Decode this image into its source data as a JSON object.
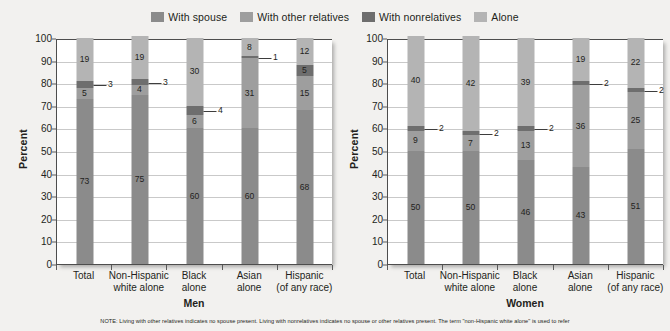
{
  "legend": {
    "items": [
      {
        "label": "With spouse",
        "color": "#8b8b8b"
      },
      {
        "label": "With other relatives",
        "color": "#9e9e9e"
      },
      {
        "label": "With nonrelatives",
        "color": "#6e6e6e"
      },
      {
        "label": "Alone",
        "color": "#b4b4b4"
      }
    ]
  },
  "note": "NOTE: Living with other relatives indicates no spouse present. Living with nonrelatives indicates no spouse or other relatives present. The term \"non-Hispanic white alone\" is used to refer",
  "axis": {
    "ylabel": "Percent",
    "yticks": [
      0,
      10,
      20,
      30,
      40,
      50,
      60,
      70,
      80,
      90,
      100
    ]
  },
  "panels": [
    {
      "key": "men",
      "title": "Men"
    },
    {
      "key": "women",
      "title": "Women"
    }
  ],
  "chart_data": {
    "type": "bar",
    "title": "",
    "subtitle": "",
    "xlabel": "",
    "ylabel": "Percent",
    "ylim": [
      0,
      100
    ],
    "ytick_step": 10,
    "grid": true,
    "stacked": true,
    "legend_position": "top-center",
    "legend_entries": [
      "With spouse",
      "With other relatives",
      "With nonrelatives",
      "Alone"
    ],
    "categories": [
      "Total",
      "Non-Hispanic white alone",
      "Black alone",
      "Asian alone",
      "Hispanic (of any race)"
    ],
    "panels": [
      {
        "name": "Men",
        "series": [
          {
            "name": "With spouse",
            "values": [
              73,
              75,
              60,
              60,
              68
            ]
          },
          {
            "name": "With other relatives",
            "values": [
              5,
              4,
              6,
              31,
              15
            ]
          },
          {
            "name": "With nonrelatives",
            "values": [
              3,
              3,
              4,
              1,
              5
            ]
          },
          {
            "name": "Alone",
            "values": [
              19,
              19,
              30,
              8,
              12
            ]
          }
        ]
      },
      {
        "name": "Women",
        "series": [
          {
            "name": "With spouse",
            "values": [
              50,
              50,
              46,
              43,
              51
            ]
          },
          {
            "name": "With other relatives",
            "values": [
              9,
              7,
              13,
              36,
              25
            ]
          },
          {
            "name": "With nonrelatives",
            "values": [
              2,
              2,
              2,
              2,
              2
            ]
          },
          {
            "name": "Alone",
            "values": [
              40,
              42,
              39,
              19,
              22
            ]
          }
        ]
      }
    ]
  }
}
